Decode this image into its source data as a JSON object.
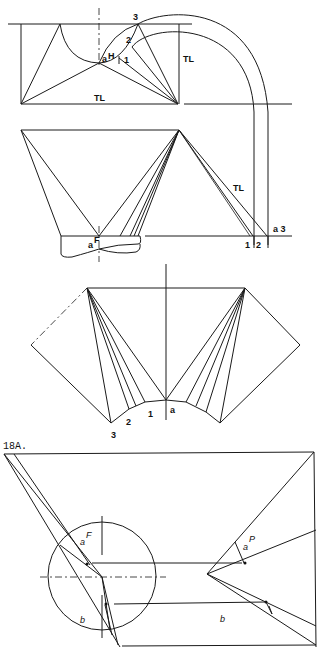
{
  "figure": {
    "caption": "18A.",
    "colors": {
      "line": "#1a1a1a",
      "background": "#ffffff"
    }
  },
  "top_view": {
    "labels": {
      "point_3": "3",
      "point_2": "2",
      "point_1": "1",
      "point_aH_a": "a",
      "point_aH_H": "H",
      "true_length_vertical": "TL",
      "true_length_horizontal": "TL"
    }
  },
  "front_view": {
    "labels": {
      "true_length": "TL",
      "point_aF_a": "a",
      "point_aF_F": "F",
      "base_1": "1",
      "base_2": "2",
      "base_a3": "a 3"
    }
  },
  "pattern": {
    "labels": {
      "p3": "3",
      "p2": "2",
      "p1": "1",
      "pa": "a"
    }
  },
  "detail_18A": {
    "labels": {
      "aF_a": "a",
      "aF_F": "F",
      "b_left": "b",
      "aP_a": "a",
      "aP_P": "P",
      "b_right": "b"
    }
  }
}
